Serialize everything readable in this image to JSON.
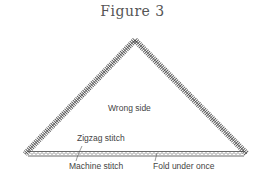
{
  "figure": {
    "title": "Figure 3"
  },
  "labels": {
    "wrong_side": "Wrong side",
    "zigzag_stitch": "Zigzag stitch",
    "machine_stitch": "Machine stitch",
    "fold_under_once": "Fold under once"
  },
  "colors": {
    "stroke": "#444444",
    "text": "#444444",
    "title": "#555555"
  }
}
